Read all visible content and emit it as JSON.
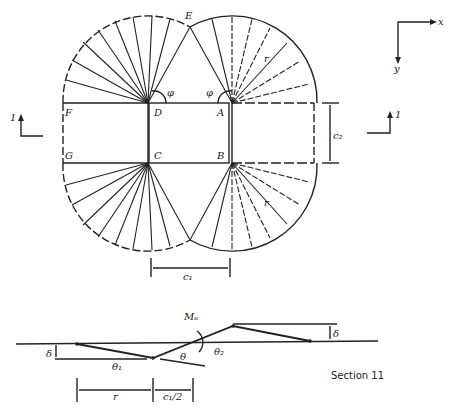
{
  "figure": {
    "points": {
      "A": "A",
      "B": "B",
      "C": "C",
      "D": "D",
      "E": "E",
      "F": "F",
      "G": "G"
    },
    "angle_phi": "φ",
    "radius": "r",
    "dim_c1": "c₁",
    "dim_c2": "c₂",
    "section_mark_left": "1",
    "section_mark_right": "1",
    "axis_x": "x",
    "axis_y": "y"
  },
  "section": {
    "moment": "Mᵤ",
    "delta": "δ",
    "theta": "θ",
    "theta1": "θ₁",
    "theta2": "θ₂",
    "dim_r": "r",
    "dim_half_c1": "c₁/2",
    "caption": "Section 11"
  },
  "colors": {
    "ink": "#222222"
  }
}
